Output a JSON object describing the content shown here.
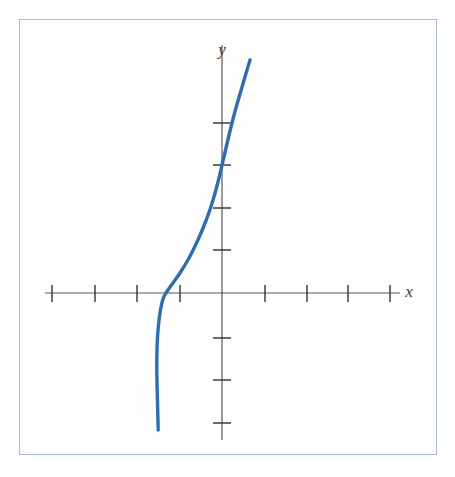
{
  "figure": {
    "title": "",
    "background_color": "#ffffff",
    "frame": {
      "name": "plot-frame",
      "border_color": "#a8bcd8",
      "x": 19,
      "y": 19,
      "width": 418,
      "height": 436
    }
  },
  "labels": {
    "x_axis": "x",
    "y_axis": "y"
  },
  "colors": {
    "curve": "#2f6cb0",
    "axis": "#58585a",
    "tick": "#3c3c3e",
    "frame_border": "#a8bcd8",
    "background": "#ffffff"
  },
  "chart_data": {
    "type": "line",
    "title": "",
    "xlabel": "x",
    "ylabel": "y",
    "grid": false,
    "legend": null,
    "annotations": [],
    "axes": {
      "origin_px": [
        222,
        293
      ],
      "unit_px": 42.3,
      "x_axis_px": {
        "start": [
          45,
          293
        ],
        "end": [
          400,
          293
        ]
      },
      "y_axis_px": {
        "start": [
          222,
          45
        ],
        "end": [
          222,
          440
        ]
      },
      "x_tick_positions_px": [
        52,
        95,
        137,
        180,
        265,
        307,
        348,
        390
      ],
      "y_tick_positions_px": [
        123,
        165,
        208,
        250,
        338,
        380,
        423
      ],
      "x_tick_values": [
        -4,
        -3,
        -2,
        -1,
        1,
        2,
        3,
        4
      ],
      "y_tick_values": [
        4,
        3,
        2,
        1,
        -1,
        -2,
        -3
      ],
      "xlim": [
        -4.4,
        4.4
      ],
      "ylim": [
        -3.4,
        4.8
      ],
      "tick_labels_shown": false
    },
    "series": [
      {
        "name": "curve",
        "color": "#2f6cb0",
        "line_width_px": 3.4,
        "points_px": [
          [
            250.0,
            60.0
          ],
          [
            247.0,
            70.0
          ],
          [
            243.5,
            82.0
          ],
          [
            240.0,
            94.0
          ],
          [
            236.5,
            106.0
          ],
          [
            233.0,
            119.0
          ],
          [
            229.5,
            133.0
          ],
          [
            226.0,
            148.0
          ],
          [
            222.5,
            163.0
          ],
          [
            219.0,
            178.0
          ],
          [
            214.5,
            195.0
          ],
          [
            209.5,
            211.0
          ],
          [
            203.5,
            227.0
          ],
          [
            196.5,
            243.0
          ],
          [
            189.0,
            258.0
          ],
          [
            180.0,
            273.0
          ],
          [
            171.5,
            285.0
          ],
          [
            166.0,
            293.0
          ],
          [
            163.0,
            299.0
          ],
          [
            160.5,
            310.0
          ],
          [
            158.8,
            322.0
          ],
          [
            157.6,
            336.0
          ],
          [
            157.0,
            350.0
          ],
          [
            156.8,
            366.0
          ],
          [
            157.0,
            382.0
          ],
          [
            157.4,
            398.0
          ],
          [
            157.8,
            414.0
          ],
          [
            158.2,
            430.0
          ]
        ],
        "curve_values": {
          "x": [
            0.66,
            0.59,
            0.51,
            0.43,
            0.34,
            0.26,
            0.18,
            0.09,
            0.01,
            -0.07,
            -0.18,
            -0.3,
            -0.44,
            -0.6,
            -0.78,
            -0.99,
            -1.19,
            -1.32,
            -1.4,
            -1.45,
            -1.5,
            -1.52,
            -1.54,
            -1.54,
            -1.54,
            -1.53,
            -1.52,
            -1.51
          ],
          "y": [
            5.51,
            5.27,
            4.99,
            4.71,
            4.42,
            4.11,
            3.78,
            3.43,
            3.07,
            2.72,
            2.32,
            1.94,
            1.56,
            1.18,
            0.83,
            0.47,
            0.19,
            0.0,
            -0.14,
            -0.4,
            -0.69,
            -1.02,
            -1.35,
            -1.73,
            -2.1,
            -2.48,
            -2.86,
            -3.24
          ]
        }
      }
    ],
    "key_features": {
      "y_intercept": 3,
      "x_intercept": -1.32,
      "shape": "increasing cubic with inflection near (-0.6, 1.5)"
    }
  },
  "icons": {
    "x_axis_arrow": "none",
    "y_axis_arrow": "none"
  }
}
